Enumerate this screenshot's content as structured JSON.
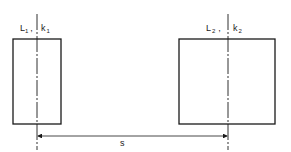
{
  "diagram": {
    "left_body": {
      "label": "L",
      "label_sub": "1",
      "axis_label": "k",
      "axis_sub": "1",
      "separator": ","
    },
    "right_body": {
      "label": "L",
      "label_sub": "2",
      "axis_label": "k",
      "axis_sub": "2",
      "separator": ","
    },
    "dimension": {
      "label": "s"
    },
    "colors": {
      "line": "#1a1a1a",
      "background": "#ffffff"
    }
  }
}
